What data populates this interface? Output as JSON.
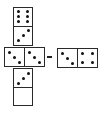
{
  "puzzle": {
    "description": "Domino sequence puzzle: cross arrangement with a separate domino pointed to by an arrow",
    "dominoes": [
      {
        "id": "top",
        "orientation": "vertical",
        "halves": [
          6,
          3
        ]
      },
      {
        "id": "middle",
        "orientation": "horizontal",
        "halves": [
          3,
          3
        ]
      },
      {
        "id": "bottom",
        "orientation": "vertical",
        "halves": [
          3,
          0
        ]
      },
      {
        "id": "option",
        "orientation": "horizontal",
        "halves": [
          3,
          4
        ]
      }
    ],
    "arrow": {
      "direction": "left",
      "from": "option",
      "to": "middle"
    },
    "colors": {
      "pip": "#111111",
      "border": "#2a2a2a",
      "background": "#ffffff"
    }
  }
}
